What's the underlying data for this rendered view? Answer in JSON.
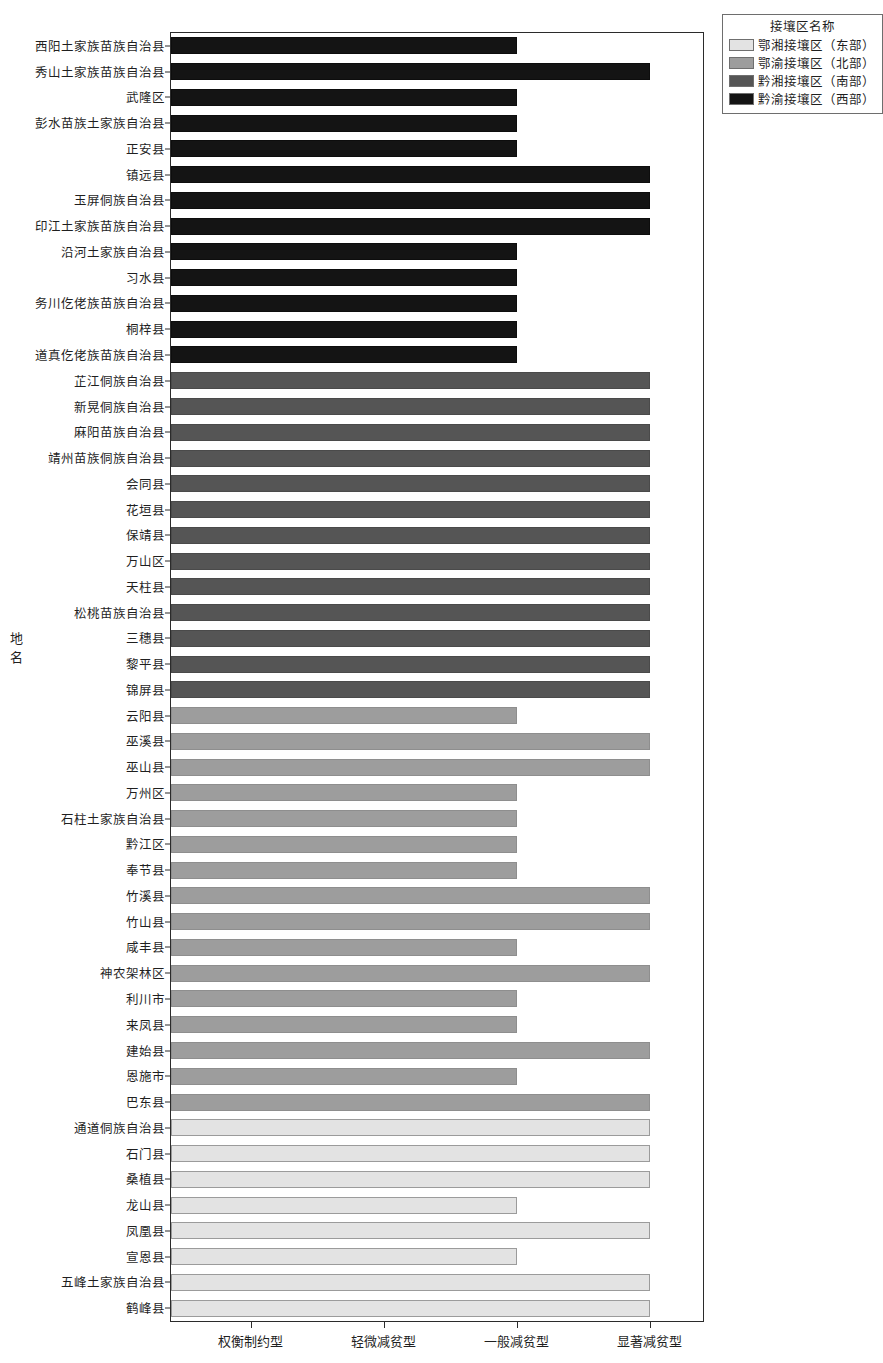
{
  "chart_data": {
    "type": "bar",
    "orientation": "horizontal",
    "title": "",
    "xlabel": "",
    "ylabel": "地名",
    "grid": false,
    "x_categories": [
      "权衡制约型",
      "轻微减贫型",
      "一般减贫型",
      "显著减贫型"
    ],
    "x_category_values": [
      1,
      2,
      3,
      4
    ],
    "xlim": [
      0.4,
      4.4
    ],
    "legend": {
      "title": "接壤区名称",
      "position": "top-right",
      "entries": [
        {
          "label": "鄂湘接壤区（东部）",
          "color": "#e3e3e3"
        },
        {
          "label": "鄂渝接壤区（北部）",
          "color": "#9d9d9d"
        },
        {
          "label": "黔湘接壤区（南部）",
          "color": "#555555"
        },
        {
          "label": "黔渝接壤区（西部）",
          "color": "#141414"
        }
      ]
    },
    "categories": [
      "西阳土家族苗族自治县",
      "秀山土家族苗族自治县",
      "武隆区",
      "彭水苗族土家族自治县",
      "正安县",
      "镇远县",
      "玉屏侗族自治县",
      "印江土家族苗族自治县",
      "沿河土家族自治县",
      "习水县",
      "务川仡佬族苗族自治县",
      "桐梓县",
      "道真仡佬族苗族自治县",
      "芷江侗族自治县",
      "新晃侗族自治县",
      "麻阳苗族自治县",
      "靖州苗族侗族自治县",
      "会同县",
      "花垣县",
      "保靖县",
      "万山区",
      "天柱县",
      "松桃苗族自治县",
      "三穗县",
      "黎平县",
      "锦屏县",
      "云阳县",
      "巫溪县",
      "巫山县",
      "万州区",
      "石柱土家族自治县",
      "黔江区",
      "奉节县",
      "竹溪县",
      "竹山县",
      "咸丰县",
      "神农架林区",
      "利川市",
      "来凤县",
      "建始县",
      "恩施市",
      "巴东县",
      "通道侗族自治县",
      "石门县",
      "桑植县",
      "龙山县",
      "凤凰县",
      "宣恩县",
      "五峰土家族自治县",
      "鹤峰县"
    ],
    "values": [
      3,
      4,
      3,
      3,
      3,
      4,
      4,
      4,
      3,
      3,
      3,
      3,
      3,
      4,
      4,
      4,
      4,
      4,
      4,
      4,
      4,
      4,
      4,
      4,
      4,
      4,
      3,
      4,
      4,
      3,
      3,
      3,
      3,
      4,
      4,
      3,
      4,
      3,
      3,
      4,
      3,
      4,
      4,
      4,
      4,
      3,
      4,
      3,
      4,
      4
    ],
    "value_labels": [
      "一般减贫型",
      "显著减贫型",
      "一般减贫型",
      "一般减贫型",
      "一般减贫型",
      "显著减贫型",
      "显著减贫型",
      "显著减贫型",
      "一般减贫型",
      "一般减贫型",
      "一般减贫型",
      "一般减贫型",
      "一般减贫型",
      "显著减贫型",
      "显著减贫型",
      "显著减贫型",
      "显著减贫型",
      "显著减贫型",
      "显著减贫型",
      "显著减贫型",
      "显著减贫型",
      "显著减贫型",
      "显著减贫型",
      "显著减贫型",
      "显著减贫型",
      "显著减贫型",
      "一般减贫型",
      "显著减贫型",
      "显著减贫型",
      "一般减贫型",
      "一般减贫型",
      "一般减贫型",
      "一般减贫型",
      "显著减贫型",
      "显著减贫型",
      "一般减贫型",
      "显著减贫型",
      "一般减贫型",
      "一般减贫型",
      "显著减贫型",
      "一般减贫型",
      "显著减贫型",
      "显著减贫型",
      "显著减贫型",
      "显著减贫型",
      "一般减贫型",
      "显著减贫型",
      "一般减贫型",
      "显著减贫型",
      "显著减贫型"
    ],
    "group_index": [
      3,
      3,
      3,
      3,
      3,
      3,
      3,
      3,
      3,
      3,
      3,
      3,
      3,
      2,
      2,
      2,
      2,
      2,
      2,
      2,
      2,
      2,
      2,
      2,
      2,
      2,
      1,
      1,
      1,
      1,
      1,
      1,
      1,
      1,
      1,
      1,
      1,
      1,
      1,
      1,
      1,
      1,
      0,
      0,
      0,
      0,
      0,
      0,
      0,
      0
    ]
  }
}
